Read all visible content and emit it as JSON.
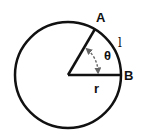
{
  "diagram": {
    "labels": {
      "point_a": "A",
      "point_b": "B",
      "angle": "θ",
      "arc_length": "l",
      "radius": "r"
    },
    "geometry": {
      "center": [
        68,
        75
      ],
      "radius": 53,
      "point_a": [
        95,
        29
      ],
      "point_b": [
        121,
        75
      ]
    },
    "colors": {
      "stroke": "#111111",
      "angle_arc": "#666666",
      "background": "#ffffff"
    }
  }
}
